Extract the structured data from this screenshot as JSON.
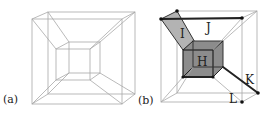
{
  "figure": {
    "panels": [
      {
        "id": "a",
        "label": "(a)",
        "description": "hypercube wireframe projection"
      },
      {
        "id": "b",
        "label": "(b)",
        "description": "hypercube projection with highlighted cells",
        "cell_labels": {
          "H": "H",
          "I": "I",
          "J": "J",
          "K": "K",
          "L": "L"
        }
      }
    ],
    "colors": {
      "thin_edge": "#a8a8a8",
      "thick_edge": "#222222",
      "cell_H_fill": "#8c8c8c",
      "cell_I_fill": "#b3b3b3",
      "text": "#222222"
    }
  }
}
